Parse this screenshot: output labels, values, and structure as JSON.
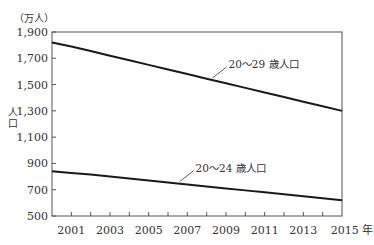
{
  "chart_data": {
    "type": "line",
    "title": "",
    "unit_label": "（万人）",
    "ylabel": "人口",
    "xlabel_suffix": "年",
    "ylim": [
      500,
      1900
    ],
    "xlim": [
      2000,
      2015
    ],
    "yticks": [
      500,
      700,
      900,
      1100,
      1300,
      1500,
      1700,
      1900
    ],
    "ytick_labels": [
      "500",
      "700",
      "900",
      "1,100",
      "1,300",
      "1,500",
      "1,700",
      "1,900"
    ],
    "xticks_minor": [
      2001,
      2002,
      2003,
      2004,
      2005,
      2006,
      2007,
      2008,
      2009,
      2010,
      2011,
      2012,
      2013,
      2014
    ],
    "xtick_labels": [
      "2001",
      "2003",
      "2005",
      "2007",
      "2009",
      "2011",
      "2013",
      "2015 年"
    ],
    "xtick_label_years": [
      2001,
      2003,
      2005,
      2007,
      2009,
      2011,
      2013,
      2015
    ],
    "grid": false,
    "x": [
      2000,
      2001,
      2002,
      2003,
      2004,
      2005,
      2006,
      2007,
      2008,
      2009,
      2010,
      2011,
      2012,
      2013,
      2014,
      2015
    ],
    "series": [
      {
        "name": "20～29 歳人口",
        "label_anchor_year": 2008.3,
        "values": [
          1820,
          1790,
          1755,
          1720,
          1685,
          1650,
          1615,
          1580,
          1545,
          1510,
          1475,
          1440,
          1405,
          1370,
          1335,
          1300
        ]
      },
      {
        "name": "20～24 歳人口",
        "label_anchor_year": 2006.6,
        "values": [
          840,
          828,
          815,
          800,
          785,
          770,
          755,
          740,
          725,
          710,
          695,
          680,
          665,
          650,
          635,
          620
        ]
      }
    ]
  }
}
